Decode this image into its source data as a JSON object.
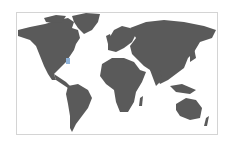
{
  "map": {
    "type": "world-map",
    "land_color": "#5a5a5a",
    "background_color": "#ffffff",
    "border_color": "#d4d4d4",
    "highlight": {
      "region": "US east coast",
      "color": "#8fb3d9"
    }
  }
}
